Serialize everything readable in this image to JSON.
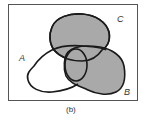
{
  "diagram": {
    "type": "venn",
    "caption": "(b)",
    "sets": [
      {
        "id": "A",
        "label": "A",
        "shaded": false
      },
      {
        "id": "B",
        "label": "B",
        "shaded": true
      },
      {
        "id": "C",
        "label": "C",
        "shaded": true
      }
    ],
    "colors": {
      "frame": "#555555",
      "outline": "#1a1a1a",
      "shade": "#a9a9a9",
      "background": "#ffffff"
    }
  }
}
